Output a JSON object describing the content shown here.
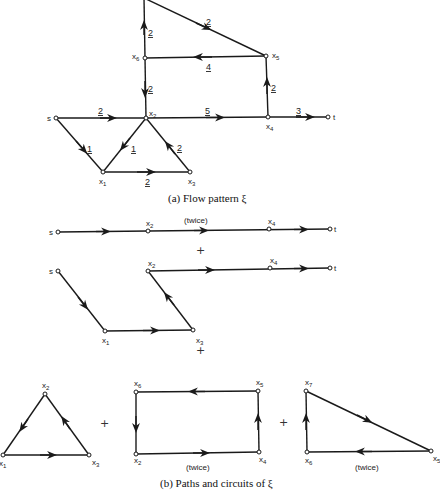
{
  "part_a": {
    "caption": "(a) Flow pattern ξ",
    "nodes": {
      "s": "s",
      "t": "t",
      "x1": "x",
      "x1_sub": "1",
      "x2": "x",
      "x2_sub": "2",
      "x3": "x",
      "x3_sub": "3",
      "x4": "x",
      "x4_sub": "4",
      "x5": "x",
      "x5_sub": "5",
      "x6": "x",
      "x6_sub": "6"
    },
    "edges": {
      "s_x2": "2",
      "x2_x4": "5",
      "x4_t": "3",
      "s_x1": "1",
      "x2_x1": "1",
      "x3_x2": "2",
      "x1_x3": "2",
      "x4_x5": "2",
      "x5_x6": "4",
      "x6_x2": "2",
      "x6_x7": "2",
      "x7_x5": "2"
    }
  },
  "part_b": {
    "caption": "(b) Paths and circuits of ξ",
    "path1": {
      "note": "(twice)",
      "s": "s",
      "t": "t",
      "x2": "x",
      "x2_sub": "2",
      "x4": "x",
      "x4_sub": "4"
    },
    "plus": "+",
    "path2": {
      "s": "s",
      "t": "t",
      "x1": "x",
      "x1_sub": "1",
      "x2": "x",
      "x2_sub": "2",
      "x3": "x",
      "x3_sub": "3",
      "x4": "x",
      "x4_sub": "4"
    },
    "circuit1": {
      "x1": "x",
      "x1_sub": "1",
      "x2": "x",
      "x2_sub": "2",
      "x3": "x",
      "x3_sub": "3"
    },
    "circuit2": {
      "note": "(twice)",
      "x2": "x",
      "x2_sub": "2",
      "x4": "x",
      "x4_sub": "4",
      "x5": "x",
      "x5_sub": "5",
      "x6": "x",
      "x6_sub": "6"
    },
    "circuit3": {
      "note": "(twice)",
      "x5": "x",
      "x5_sub": "5",
      "x6": "x",
      "x6_sub": "6",
      "x7": "x",
      "x7_sub": "7"
    }
  }
}
